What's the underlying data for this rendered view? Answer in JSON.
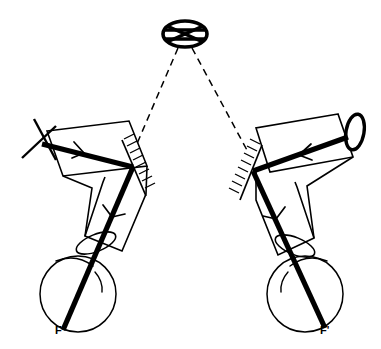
{
  "figure": {
    "background_color": "#ffffff",
    "stroke_color": "#000000",
    "width": 381,
    "height": 349
  },
  "labels": {
    "left_focal_point": "F",
    "right_focal_point": "F'"
  },
  "components": {
    "target_reticle": {
      "name": "crossed-ellipse-target",
      "center_x": 185,
      "center_y": 34,
      "radius_x": 22,
      "radius_y": 13
    },
    "left_assembly": {
      "eyepiece_cross": "cross-reticle",
      "prism_mirror": "hatched-mirror",
      "eye": "observer-eye-left",
      "ray_direction": "rightward"
    },
    "right_assembly": {
      "objective_lens": "ellipse-lens",
      "prism_mirror": "hatched-mirror",
      "eye": "observer-eye-right",
      "ray_direction": "leftward"
    },
    "sight_lines": {
      "style": "dashed",
      "count": 2,
      "from": "target_reticle",
      "to": [
        "left_prism_mirror",
        "right_prism_mirror"
      ]
    }
  },
  "geometry": {
    "left_eye": {
      "cx": 78,
      "cy": 294,
      "r": 38
    },
    "right_eye": {
      "cx": 305,
      "cy": 294,
      "r": 38
    },
    "left_lens_ellipse": {
      "cx": 96,
      "cy": 243,
      "rx": 9,
      "ry": 22,
      "rotate": 35
    },
    "right_lens_ellipse": {
      "cx": 288,
      "cy": 243,
      "rx": 9,
      "ry": 22,
      "rotate": -35
    },
    "objective_ellipse": {
      "cx": 356,
      "cy": 131,
      "rx": 9,
      "ry": 17,
      "rotate": 10
    }
  }
}
